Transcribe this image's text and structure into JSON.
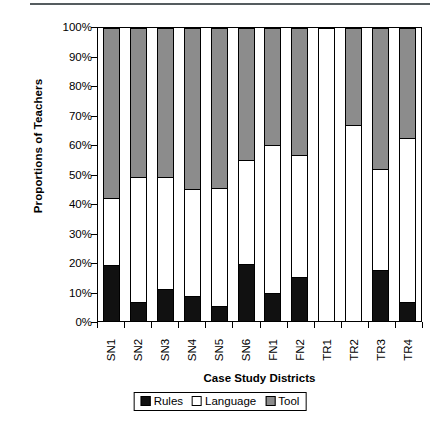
{
  "chart_data": {
    "type": "bar",
    "subtype": "stacked-percentage",
    "title": "",
    "xlabel": "Case Study Districts",
    "ylabel": "Proportions of Teachers",
    "categories": [
      "SN1",
      "SN2",
      "SN3",
      "SN4",
      "SN5",
      "SN6",
      "FN1",
      "FN2",
      "TR1",
      "TR2",
      "TR3",
      "TR4"
    ],
    "ylim": [
      0,
      100
    ],
    "ytick_labels": [
      "100%",
      "90%",
      "80%",
      "70%",
      "60%",
      "50%",
      "40%",
      "30%",
      "20%",
      "10%",
      "0%"
    ],
    "ytick_values": [
      100,
      90,
      80,
      70,
      60,
      50,
      40,
      30,
      20,
      10,
      0
    ],
    "grid": false,
    "legend_position": "bottom",
    "series": [
      {
        "name": "Rules",
        "color": "#111111",
        "values": [
          19,
          6.5,
          11,
          8.5,
          5,
          19.5,
          9.5,
          15,
          0,
          0,
          17.5,
          6.5
        ]
      },
      {
        "name": "Language",
        "color": "#ffffff",
        "values": [
          23,
          42.5,
          38,
          36.5,
          40.5,
          35.5,
          50.5,
          41.5,
          100,
          67,
          34.5,
          56
        ]
      },
      {
        "name": "Tool",
        "color": "#8c8c8c",
        "values": [
          58,
          51,
          51,
          55,
          54.5,
          45,
          40,
          43.5,
          0,
          33,
          48,
          37.5
        ]
      }
    ],
    "cumulative_tops": {
      "rules_top": [
        19,
        6.5,
        11,
        8.5,
        5,
        19.5,
        9.5,
        15,
        0,
        0,
        17.5,
        6.5
      ],
      "language_top": [
        42,
        49,
        49,
        45,
        45.5,
        55,
        60,
        56.5,
        100,
        67,
        52,
        62.5
      ],
      "tool_top": [
        100,
        100,
        100,
        100,
        100,
        100,
        100,
        100,
        100,
        100,
        100,
        100
      ]
    }
  },
  "legend": {
    "items": [
      {
        "label": "Rules",
        "color": "#111111"
      },
      {
        "label": "Language",
        "color": "#ffffff"
      },
      {
        "label": "Tool",
        "color": "#8c8c8c"
      }
    ]
  }
}
